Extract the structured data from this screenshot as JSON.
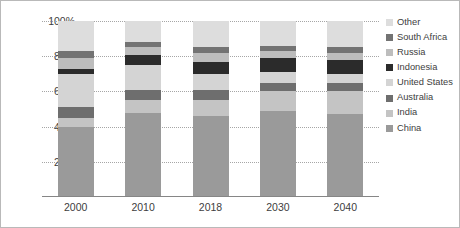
{
  "chart_data": {
    "type": "bar",
    "subtype": "stacked-100-percent",
    "title": "",
    "xlabel": "",
    "ylabel": "",
    "categories": [
      "2000",
      "2010",
      "2018",
      "2030",
      "2040"
    ],
    "ylim": [
      0,
      100
    ],
    "yticks": [
      "20%",
      "40%",
      "60%",
      "80%",
      "100%"
    ],
    "ytick_values": [
      20,
      40,
      60,
      80,
      100
    ],
    "grid": true,
    "grid_style": "dotted-horizontal",
    "legend_position": "right",
    "stack_order_bottom_to_top": [
      "China",
      "India",
      "Australia",
      "United States",
      "Indonesia",
      "Russia",
      "South Africa",
      "Other"
    ],
    "series": [
      {
        "name": "China",
        "color": "#9a9a9a",
        "values": [
          40,
          48,
          46,
          49,
          47
        ]
      },
      {
        "name": "India",
        "color": "#c4c4c4",
        "values": [
          5,
          7,
          9,
          11,
          13
        ]
      },
      {
        "name": "Australia",
        "color": "#6e6e6e",
        "values": [
          6,
          6,
          6,
          5,
          5
        ]
      },
      {
        "name": "United States",
        "color": "#d4d4d4",
        "values": [
          19,
          14,
          9,
          6,
          5
        ]
      },
      {
        "name": "Indonesia",
        "color": "#2b2b2b",
        "values": [
          3,
          6,
          7,
          8,
          8
        ]
      },
      {
        "name": "Russia",
        "color": "#bdbdbd",
        "values": [
          6,
          4,
          5,
          4,
          4
        ]
      },
      {
        "name": "South Africa",
        "color": "#737373",
        "values": [
          4,
          3,
          3,
          3,
          3
        ]
      },
      {
        "name": "Other",
        "color": "#dddddd",
        "values": [
          17,
          12,
          15,
          14,
          15
        ]
      }
    ]
  },
  "legend": {
    "items": [
      {
        "label": "Other",
        "color": "#dddddd"
      },
      {
        "label": "South Africa",
        "color": "#737373"
      },
      {
        "label": "Russia",
        "color": "#bdbdbd"
      },
      {
        "label": "Indonesia",
        "color": "#2b2b2b"
      },
      {
        "label": "United States",
        "color": "#d4d4d4"
      },
      {
        "label": "Australia",
        "color": "#6e6e6e"
      },
      {
        "label": "India",
        "color": "#c4c4c4"
      },
      {
        "label": "China",
        "color": "#9a9a9a"
      }
    ]
  }
}
